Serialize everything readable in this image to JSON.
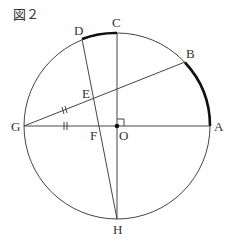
{
  "figure": {
    "title": "図２",
    "labels": {
      "A": "A",
      "B": "B",
      "C": "C",
      "D": "D",
      "E": "E",
      "F": "F",
      "G": "G",
      "H": "H",
      "O": "O"
    }
  },
  "geometry": {
    "circle": {
      "cx": 117,
      "cy": 126,
      "r": 93
    },
    "points": {
      "O": [
        117,
        126
      ],
      "A": [
        210,
        126
      ],
      "G": [
        24,
        126
      ],
      "C": [
        117,
        33
      ],
      "H": [
        117,
        219
      ],
      "B": [
        185,
        62
      ],
      "D": [
        82,
        38
      ],
      "E": [
        93,
        98
      ],
      "F": [
        100,
        126
      ]
    },
    "segments": [
      "GA",
      "CH",
      "GB",
      "DH"
    ],
    "thick_arcs": [
      "DC",
      "BA"
    ],
    "equal_marks": [
      "GE",
      "GF"
    ],
    "right_angle_at": "O"
  }
}
